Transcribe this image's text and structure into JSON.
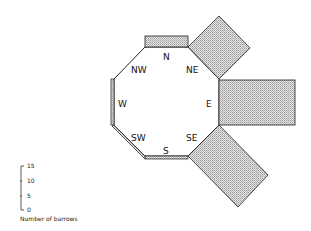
{
  "diagram": {
    "type": "octagonal-rose",
    "directions": [
      {
        "label": "N",
        "value": 4
      },
      {
        "label": "NE",
        "value": 15
      },
      {
        "label": "E",
        "value": 26
      },
      {
        "label": "SE",
        "value": 24
      },
      {
        "label": "S",
        "value": 1
      },
      {
        "label": "SW",
        "value": 1
      },
      {
        "label": "W",
        "value": 1
      },
      {
        "label": "NW",
        "value": 0
      }
    ],
    "fill_color": "#d4d4d4",
    "stroke_color": "#222222"
  },
  "scale": {
    "ticks": [
      "15",
      "10",
      "5",
      "0"
    ],
    "caption": "Number of barrows"
  }
}
